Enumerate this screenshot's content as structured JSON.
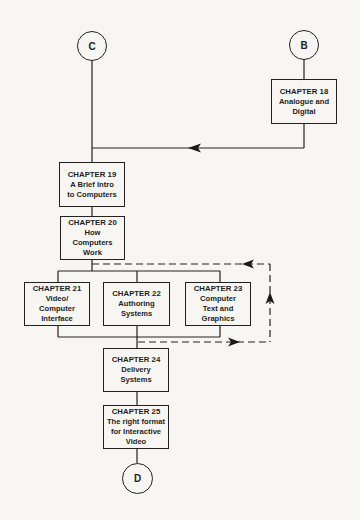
{
  "connectors": {
    "c": "C",
    "b": "B",
    "d": "D"
  },
  "chapters": [
    {
      "id": "ch18",
      "title": "CHAPTER 18",
      "lines": [
        "Analogue and",
        "Digital"
      ]
    },
    {
      "id": "ch19",
      "title": "CHAPTER 19",
      "lines": [
        "A Brief Intro",
        "to Computers"
      ]
    },
    {
      "id": "ch20",
      "title": "CHAPTER 20",
      "lines": [
        "How",
        "Computers",
        "Work"
      ]
    },
    {
      "id": "ch21",
      "title": "CHAPTER 21",
      "lines": [
        "Video/",
        "Computer",
        "Interface"
      ]
    },
    {
      "id": "ch22",
      "title": "CHAPTER 22",
      "lines": [
        "Authoring",
        "Systems"
      ]
    },
    {
      "id": "ch23",
      "title": "CHAPTER 23",
      "lines": [
        "Computer",
        "Text and",
        "Graphics"
      ]
    },
    {
      "id": "ch24",
      "title": "CHAPTER 24",
      "lines": [
        "Delivery",
        "Systems"
      ]
    },
    {
      "id": "ch25",
      "title": "CHAPTER 25",
      "lines": [
        "The right format",
        "for Interactive",
        "Video"
      ]
    }
  ],
  "colors": {
    "background": "#f7f6f3",
    "line": "#222222"
  }
}
